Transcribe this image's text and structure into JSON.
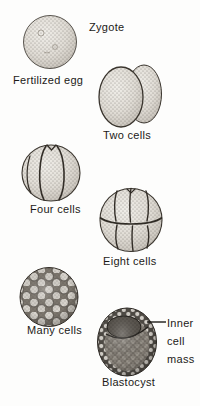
{
  "labels": {
    "zygote": "Zygote",
    "fertilized_egg": "Fertilized egg",
    "two_cells": "Two cells",
    "four_cells": "Four cells",
    "eight_cells": "Eight cells",
    "many_cells": "Many cells",
    "blastocyst": "Blastocyst",
    "inner_cell_mass_lines": [
      "Inner",
      "cell",
      "mass"
    ]
  },
  "colors": {
    "background": "#fdfdfc",
    "ink": "#1c1a17",
    "cell_fill": "#dcd8d1",
    "cell_shadow": "#aaa49b",
    "icm_dark": "#57524b"
  }
}
